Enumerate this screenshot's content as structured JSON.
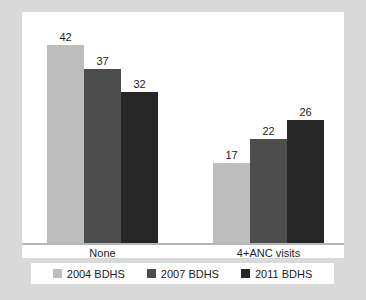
{
  "chart_data": {
    "type": "bar",
    "title": "",
    "subtitle": "",
    "xlabel": "",
    "ylabel": "",
    "categories": [
      "None",
      "4+ANC visits"
    ],
    "series": [
      {
        "name": "2004 BDHS",
        "color": "#bdbdbd",
        "values": [
          42,
          17
        ]
      },
      {
        "name": "2007 BDHS",
        "color": "#4d4d4d",
        "values": [
          37,
          22
        ]
      },
      {
        "name": "2011 BDHS",
        "color": "#262626",
        "values": [
          32,
          26
        ]
      }
    ],
    "ylim": [
      0,
      49
    ],
    "grid": false,
    "legend_position": "bottom",
    "value_labels": true
  },
  "figure": {
    "background_color": "#d9d9d9",
    "plot_background_color": "#ffffff",
    "axis_color": "#b5b5b5"
  },
  "groups": [
    {
      "category": "None",
      "bars": [
        {
          "series": "2004 BDHS",
          "value": 42,
          "label": "42",
          "color": "#bdbdbd"
        },
        {
          "series": "2007 BDHS",
          "value": 37,
          "label": "37",
          "color": "#4d4d4d"
        },
        {
          "series": "2011 BDHS",
          "value": 32,
          "label": "32",
          "color": "#262626"
        }
      ]
    },
    {
      "category": "4+ANC visits",
      "bars": [
        {
          "series": "2004 BDHS",
          "value": 17,
          "label": "17",
          "color": "#bdbdbd"
        },
        {
          "series": "2007 BDHS",
          "value": 22,
          "label": "22",
          "color": "#4d4d4d"
        },
        {
          "series": "2011 BDHS",
          "value": 26,
          "label": "26",
          "color": "#262626"
        }
      ]
    }
  ],
  "legend": {
    "items": [
      {
        "label": "2004 BDHS",
        "color": "#bdbdbd"
      },
      {
        "label": "2007 BDHS",
        "color": "#4d4d4d"
      },
      {
        "label": "2011 BDHS",
        "color": "#262626"
      }
    ]
  }
}
